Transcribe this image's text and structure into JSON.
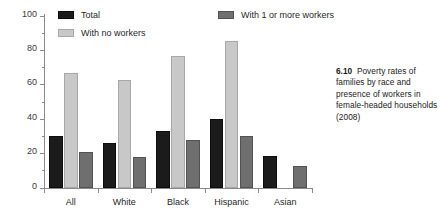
{
  "figure": {
    "caption_number": "6.10",
    "caption_text": "Poverty rates of families by race and presence of workers in female-headed households (2008)"
  },
  "axes": {
    "ylabel": "Percentage",
    "yticks": [
      "0",
      "20",
      "40",
      "60",
      "80",
      "100"
    ],
    "ytick_values": [
      0,
      20,
      40,
      60,
      80,
      100
    ],
    "yminor_values": [
      10,
      30,
      50,
      70,
      90
    ],
    "xlabel": ""
  },
  "legend": {
    "items": [
      {
        "label": "Total",
        "key": "total",
        "color": "#1b1b1b"
      },
      {
        "label": "With no workers",
        "key": "noworkers",
        "color": "#c8c8c8"
      },
      {
        "label": "With 1 or more workers",
        "key": "workers",
        "color": "#6f6f6f"
      }
    ]
  },
  "chart_data": {
    "type": "bar",
    "title": "Poverty rates of families by race and presence of workers in female-headed households (2008)",
    "xlabel": "",
    "ylabel": "Percentage",
    "ylim": [
      0,
      100
    ],
    "grid": false,
    "legend_position": "top",
    "categories": [
      "All",
      "White",
      "Black",
      "Hispanic",
      "Asian"
    ],
    "series": [
      {
        "name": "Total",
        "color": "#1b1b1b",
        "values": [
          30,
          26,
          33,
          40,
          18.5
        ]
      },
      {
        "name": "With no workers",
        "color": "#c8c8c8",
        "values": [
          67,
          63,
          77,
          85.5,
          null
        ]
      },
      {
        "name": "With 1 or more workers",
        "color": "#6f6f6f",
        "values": [
          21,
          18,
          28,
          30,
          13
        ]
      }
    ]
  }
}
